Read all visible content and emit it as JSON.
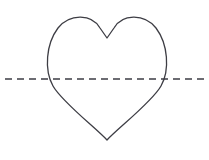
{
  "canvas": {
    "width": 209,
    "height": 160,
    "background_color": "#ffffff"
  },
  "figure": {
    "stroke_color": "#3d3d44",
    "stroke_width": 1.3,
    "dash_stroke_color": "#3d3d44",
    "dash_stroke_width": 1.6,
    "dash_pattern": "7 5"
  },
  "chart_data": {
    "type": "line",
    "xlabel": "",
    "ylabel": "",
    "grid": false,
    "legend": null,
    "xlim": [
      0,
      209
    ],
    "ylim": [
      0,
      160
    ],
    "annotations": [
      {
        "name": "heart-outline",
        "description": "Closed heart curve outline",
        "left_extreme_x": 48,
        "right_extreme_x": 168,
        "top_lobe_y": 17,
        "cleft_point": [
          107,
          38
        ],
        "bottom_tip": [
          107,
          140
        ],
        "width": 120,
        "height": 123
      },
      {
        "name": "dashed-horizontal-line",
        "description": "Horizontal dashed line crossing the heart",
        "y": 79,
        "x_start": 5,
        "x_end": 205,
        "length": 200
      }
    ],
    "series": [
      {
        "name": "heart-outline-path",
        "path_commands": "M 107 140 C 96 128 62 102 53 86 C 44 70 46 44 58 28 C 70 13 92 14 100 28 L 107 38 L 114 28 C 122 14 144 13 156 28 C 168 44 170 70 161 86 C 152 102 118 128 107 140 Z"
      },
      {
        "name": "dashed-line-path",
        "x": [
          5,
          205
        ],
        "y": [
          79,
          79
        ]
      }
    ]
  }
}
